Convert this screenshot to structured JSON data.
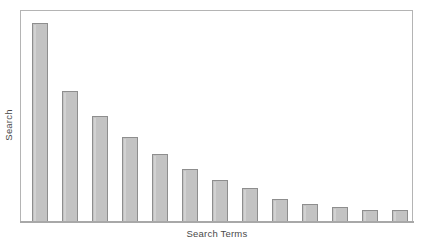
{
  "chart_data": {
    "type": "bar",
    "title": "",
    "subtitle": "",
    "xlabel": "Search Terms",
    "ylabel": "Search",
    "grid": false,
    "legend": null,
    "axis_tick_labels": {
      "x": [],
      "y": []
    },
    "ylim": [
      0,
      100
    ],
    "categories": [
      "1",
      "2",
      "3",
      "4",
      "5",
      "6",
      "7",
      "8",
      "9",
      "10",
      "11",
      "12",
      "13"
    ],
    "values": [
      94,
      62,
      50,
      40,
      32,
      25,
      20,
      16,
      11,
      8.5,
      7,
      5.7,
      5.7
    ],
    "bar_color": "#c3c3c3",
    "bar_border_color": "#8e8e8e",
    "frame_color": "#b4b4b4",
    "axis_color": "#a8a8a8",
    "background": "#ffffff",
    "annotations": []
  },
  "geometry": {
    "plot": {
      "left": 20,
      "top": 10,
      "width": 393,
      "height": 212,
      "baseline_y": 222
    },
    "bar_width": 16,
    "bar_lefts": [
      32,
      62,
      92,
      122,
      152,
      182,
      212,
      242,
      272,
      302,
      332,
      362,
      392
    ],
    "bar_tops": [
      22,
      90,
      116,
      138,
      155,
      170,
      180,
      189,
      198,
      204,
      207,
      210,
      210
    ]
  },
  "labels": {
    "y_axis": "Search",
    "x_axis": "Search Terms"
  }
}
